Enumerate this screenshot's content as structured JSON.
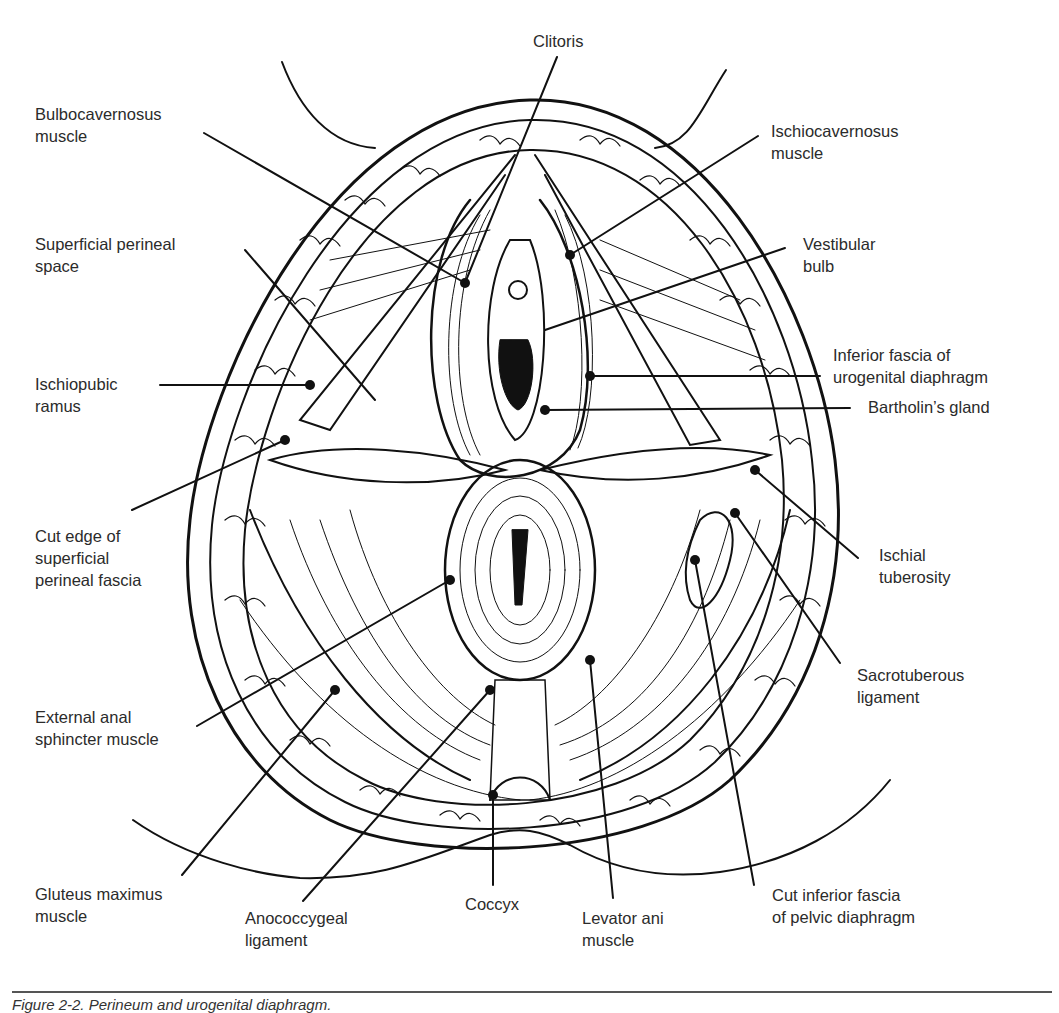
{
  "figure": {
    "caption": "Figure 2-2. Perineum and urogenital diaphragm.",
    "style": "black-and-white anatomical line drawing",
    "colors": {
      "ink": "#111111",
      "label_text": "#2b2b2b",
      "background": "#ffffff",
      "rule": "#555555"
    }
  },
  "labels": {
    "clitoris": [
      "Clitoris"
    ],
    "bulbocavernosus": [
      "Bulbocavernosus",
      "muscle"
    ],
    "ischiocavernosus": [
      "Ischiocavernosus",
      "muscle"
    ],
    "superficial_perineal_space": [
      "Superficial perineal",
      "space"
    ],
    "vestibular_bulb": [
      "Vestibular",
      "bulb"
    ],
    "ischiopubic_ramus": [
      "Ischiopubic",
      "ramus"
    ],
    "inferior_fascia_ug": [
      "Inferior fascia of",
      "urogenital diaphragm"
    ],
    "bartholins_gland": [
      "Bartholin’s gland"
    ],
    "cut_edge_fascia": [
      "Cut edge of",
      "superficial",
      "perineal fascia"
    ],
    "ischial_tuberosity": [
      "Ischial",
      "tuberosity"
    ],
    "sacrotuberous": [
      "Sacrotuberous",
      "ligament"
    ],
    "external_anal_sphincter": [
      "External anal",
      "sphincter muscle"
    ],
    "gluteus_maximus": [
      "Gluteus maximus",
      "muscle"
    ],
    "anococcygeal": [
      "Anococcygeal",
      "ligament"
    ],
    "coccyx": [
      "Coccyx"
    ],
    "levator_ani": [
      "Levator ani",
      "muscle"
    ],
    "cut_inferior_fascia_pelvic": [
      "Cut inferior fascia",
      "of pelvic diaphragm"
    ]
  }
}
